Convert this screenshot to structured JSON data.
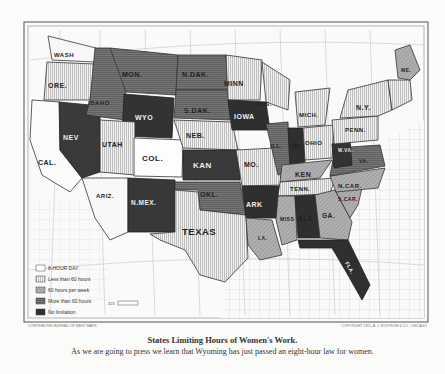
{
  "map": {
    "title": "States Limiting Hours of Women's Work.",
    "subtitle": "As we are going to press we learn that Wyoming has just passed an eight-hour law for women.",
    "credit_left": "CONTRIBUTED BUREAU OF WEST MAPS",
    "credit_right": "COPYRIGHT 1915, A. J. NYSTROM & CO., CHICAGO",
    "scale_label": "323"
  },
  "legend": {
    "items": [
      {
        "label": "8-HOUR DAY",
        "key": "eight-hour",
        "fill": "#ffffff"
      },
      {
        "label": "Less than 60 hours",
        "key": "less-60",
        "fill": "#e6e6e6"
      },
      {
        "label": "60 hours per week",
        "key": "sixty",
        "fill": "#a8a8a8"
      },
      {
        "label": "More than 60 hours",
        "key": "more-60",
        "fill": "#6a6a6a"
      },
      {
        "label": "No limitation",
        "key": "none",
        "fill": "#2e2e2e"
      }
    ]
  },
  "states": [
    {
      "name": "WASH",
      "category": "eight-hour"
    },
    {
      "name": "ORE.",
      "category": "less-60"
    },
    {
      "name": "CAL.",
      "category": "eight-hour"
    },
    {
      "name": "IDAHO",
      "category": "more-60"
    },
    {
      "name": "NEV",
      "category": "none"
    },
    {
      "name": "MON.",
      "category": "more-60"
    },
    {
      "name": "WYO",
      "category": "none"
    },
    {
      "name": "UTAH",
      "category": "less-60"
    },
    {
      "name": "ARIZ.",
      "category": "eight-hour"
    },
    {
      "name": "COL.",
      "category": "eight-hour"
    },
    {
      "name": "N.MEX.",
      "category": "none"
    },
    {
      "name": "N.DAK.",
      "category": "more-60"
    },
    {
      "name": "S.DAK.",
      "category": "more-60"
    },
    {
      "name": "NEB.",
      "category": "less-60"
    },
    {
      "name": "KAN",
      "category": "none"
    },
    {
      "name": "OKL.",
      "category": "more-60"
    },
    {
      "name": "TEXAS",
      "category": "less-60"
    },
    {
      "name": "MINN",
      "category": "less-60"
    },
    {
      "name": "IOWA",
      "category": "none"
    },
    {
      "name": "MO.",
      "category": "less-60"
    },
    {
      "name": "ARK",
      "category": "none"
    },
    {
      "name": "LA.",
      "category": "sixty"
    },
    {
      "name": "WIS.",
      "category": "less-60"
    },
    {
      "name": "ILL.",
      "category": "more-60"
    },
    {
      "name": "IND",
      "category": "none"
    },
    {
      "name": "MICH.",
      "category": "less-60"
    },
    {
      "name": "OHIO",
      "category": "less-60"
    },
    {
      "name": "KEN",
      "category": "sixty"
    },
    {
      "name": "TENN.",
      "category": "less-60"
    },
    {
      "name": "MISS",
      "category": "sixty"
    },
    {
      "name": "ALA",
      "category": "none"
    },
    {
      "name": "GA.",
      "category": "sixty"
    },
    {
      "name": "FLA.",
      "category": "none"
    },
    {
      "name": "S.CAR.",
      "category": "sixty"
    },
    {
      "name": "N.CAR.",
      "category": "sixty"
    },
    {
      "name": "VA.",
      "category": "more-60"
    },
    {
      "name": "W.VA.",
      "category": "none"
    },
    {
      "name": "PENN.",
      "category": "less-60"
    },
    {
      "name": "N.Y.",
      "category": "less-60"
    },
    {
      "name": "ME.",
      "category": "sixty"
    }
  ]
}
